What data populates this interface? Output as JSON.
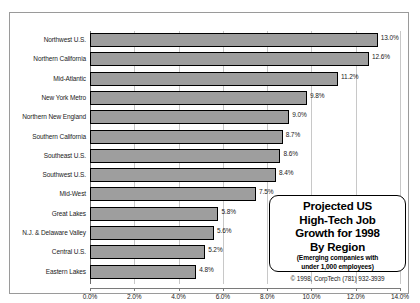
{
  "chart_data": {
    "type": "bar",
    "orientation": "horizontal",
    "title": "",
    "xlabel": "",
    "ylabel": "",
    "xlim": [
      0,
      14
    ],
    "xtick_labels": [
      "0.0%",
      "2.0%",
      "4.0%",
      "6.0%",
      "8.0%",
      "10.0%",
      "12.0%",
      "14.0%"
    ],
    "xticks": [
      0,
      2,
      4,
      6,
      8,
      10,
      12,
      14
    ],
    "grid": true,
    "legend": "none",
    "categories": [
      "Northwest U.S.",
      "Northern California",
      "Mid-Atlantic",
      "New York Metro",
      "Northern New England",
      "Southern California",
      "Southeast U.S.",
      "Southwest U.S.",
      "Mid-West",
      "Great Lakes",
      "N.J. & Delaware Valley",
      "Central U.S.",
      "Eastern Lakes"
    ],
    "values": [
      13.0,
      12.6,
      11.2,
      9.8,
      9.0,
      8.7,
      8.6,
      8.4,
      7.5,
      5.8,
      5.6,
      5.2,
      4.8
    ],
    "value_labels": [
      "13.0%",
      "12.6%",
      "11.2%",
      "9.8%",
      "9.0%",
      "8.7%",
      "8.6%",
      "8.4%",
      "7.5%",
      "5.8%",
      "5.6%",
      "5.2%",
      "4.8%"
    ],
    "bar_color": "#9e9e9e",
    "bar_edge_color": "#000000"
  },
  "callout": {
    "line1": "Projected US",
    "line2": "High-Tech Job",
    "line3": "Growth for 1998",
    "line4": "By Region",
    "sub1": "(Emerging companies with",
    "sub2": "under 1,000 employees)"
  },
  "copyright": "© 1998, CorpTech (781) 932-3939"
}
